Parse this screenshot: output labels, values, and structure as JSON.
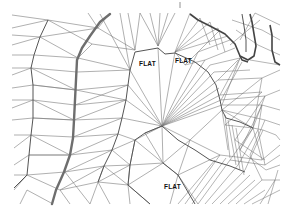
{
  "figure": {
    "type": "TIN terrain triangulation with contour lines",
    "labels": [
      {
        "text": "FLAT",
        "x": 139,
        "y": 60
      },
      {
        "text": "FLAT",
        "x": 175,
        "y": 57
      },
      {
        "text": "FLAT",
        "x": 164,
        "y": 183
      }
    ],
    "colors": {
      "background": "#ffffff",
      "triangle_edges": "#7a7a7a",
      "contour_lines": "#6e6e6e",
      "label_text": "#111111"
    }
  }
}
